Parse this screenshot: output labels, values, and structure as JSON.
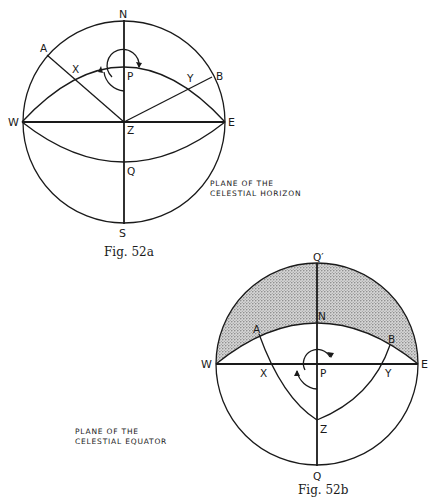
{
  "figures": [
    {
      "id": "fig52a",
      "caption": "Fig. 52a",
      "plane_label": [
        "PLANE OF THE",
        "CELESTIAL HORIZON"
      ],
      "points": {
        "N": "N",
        "S": "S",
        "W": "W",
        "E": "E",
        "Z": "Z",
        "P": "P",
        "Q": "Q",
        "A": "A",
        "B": "B",
        "X": "X",
        "Y": "Y"
      }
    },
    {
      "id": "fig52b",
      "caption": "Fig. 52b",
      "plane_label": [
        "PLANE OF THE",
        "CELESTIAL EQUATOR"
      ],
      "points": {
        "Qp": "Q′",
        "Q": "Q",
        "W": "W",
        "E": "E",
        "N": "N",
        "P": "P",
        "Z": "Z",
        "A": "A",
        "B": "B",
        "X": "X",
        "Y": "Y"
      },
      "shading": "stippled region above horizon arc"
    }
  ],
  "colors": {
    "ink": "#1a1a1a",
    "shade": "#bdbdbd",
    "paper": "#ffffff"
  }
}
